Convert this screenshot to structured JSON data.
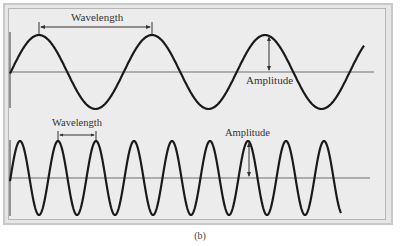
{
  "figure": {
    "caption": "(b)",
    "panels": [
      {
        "name": "long-wavelength-wave",
        "wavelength_label": "Wavelength",
        "amplitude_label": "Amplitude",
        "midline_y": 72,
        "amplitude_px": 37,
        "period_px": 113,
        "x_start": 10,
        "x_end": 364
      },
      {
        "name": "short-wavelength-wave",
        "wavelength_label": "Wavelength",
        "amplitude_label": "Amplitude",
        "midline_y": 178,
        "amplitude_px": 37,
        "period_px": 38,
        "x_start": 10,
        "x_end": 341
      }
    ],
    "colors": {
      "wave": "#1a1a1a",
      "axis": "#6e6e6e",
      "background": "#ececec"
    }
  }
}
